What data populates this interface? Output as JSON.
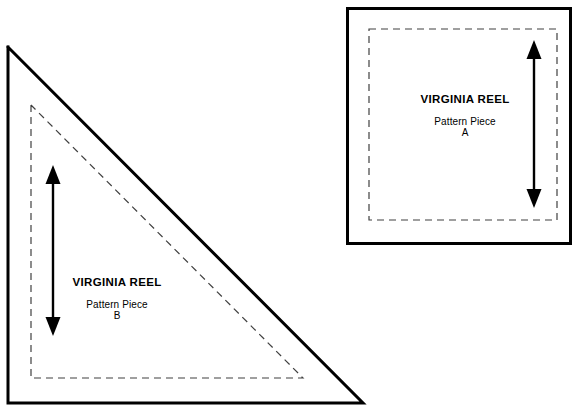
{
  "document": {
    "kind": "sewing-pattern-template-sheet",
    "background_color": "#ffffff",
    "line_color": "#000000",
    "width": 579,
    "height": 406
  },
  "pieces": [
    {
      "id": "B",
      "shape": "right-triangle",
      "name": "triangle-pattern-piece-b",
      "title": "VIRGINIA REEL",
      "subtitle": "Pattern Piece",
      "letter": "B",
      "cut_line": {
        "style": "solid",
        "stroke_width": 3,
        "points": [
          [
            8,
            47
          ],
          [
            8,
            403
          ],
          [
            363,
            403
          ]
        ]
      },
      "seam_line": {
        "style": "dashed",
        "stroke_width": 1.2,
        "dash": "7,5",
        "points": [
          [
            31,
            105
          ],
          [
            31,
            378
          ],
          [
            303,
            378
          ]
        ]
      },
      "grain_arrow": {
        "name": "grain-line-arrow-b",
        "orientation": "vertical",
        "x": 53,
        "y_top": 165,
        "y_bottom": 336,
        "head_width": 15,
        "head_height": 19,
        "shaft_width": 2.4
      }
    },
    {
      "id": "A",
      "shape": "square",
      "name": "square-pattern-piece-a",
      "title": "VIRGINIA REEL",
      "subtitle": "Pattern Piece",
      "letter": "A",
      "cut_line": {
        "style": "solid",
        "stroke_width": 3,
        "rect": [
          346,
          7,
          226,
          238
        ]
      },
      "seam_line": {
        "style": "dashed",
        "stroke_width": 1.2,
        "dash": "7,5",
        "rect": [
          369,
          29,
          188,
          191
        ]
      },
      "grain_arrow": {
        "name": "grain-line-arrow-a",
        "orientation": "vertical",
        "x": 534,
        "y_top": 40,
        "y_bottom": 208,
        "head_width": 15,
        "head_height": 19,
        "shaft_width": 2.4
      }
    }
  ]
}
